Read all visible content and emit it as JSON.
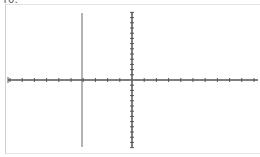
{
  "header": {
    "title": "Y0:"
  },
  "chart_data": {
    "type": "line",
    "title": "",
    "xlabel": "",
    "ylabel": "",
    "series": [],
    "axes": {
      "x_axis_y_px": 80,
      "y_axis_x_px": 132,
      "x_tick_count_left": 7,
      "x_tick_count_right": 8,
      "y_tick_count_up": 13,
      "y_tick_count_down": 13
    },
    "cursor_line_x_px": 82,
    "grid": false,
    "colors": {
      "axis": "#555555",
      "cursor": "#999999",
      "frame": "#cfcfcf"
    }
  }
}
